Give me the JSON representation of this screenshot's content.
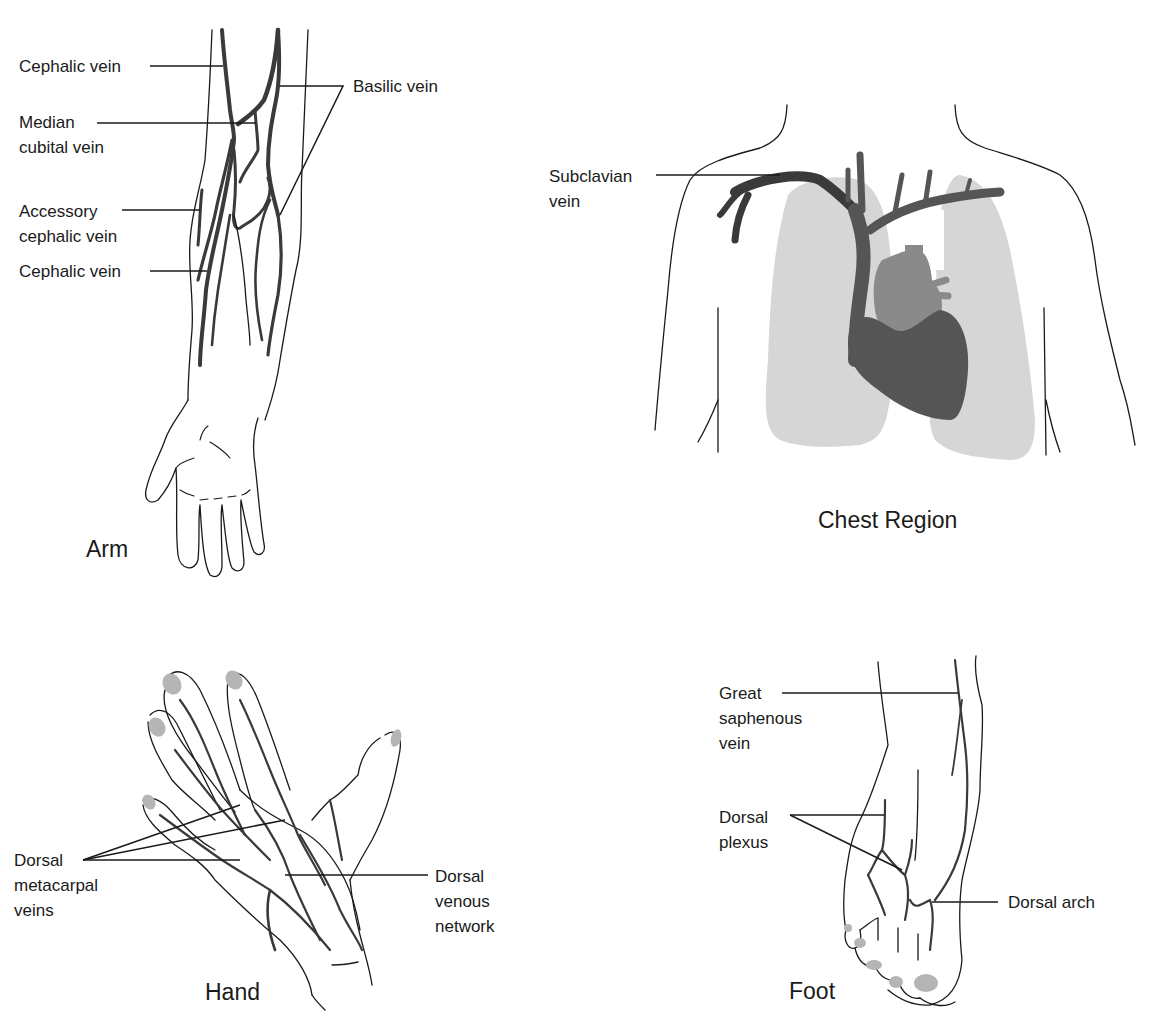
{
  "figure": {
    "panels": [
      {
        "id": "arm",
        "caption": "Arm",
        "labels": [
          {
            "id": "cephalic-vein-upper",
            "text": "Cephalic vein"
          },
          {
            "id": "basilic-vein",
            "text": "Basilic vein"
          },
          {
            "id": "median-cubital-vein",
            "text": "Median\ncubital vein"
          },
          {
            "id": "accessory-cephalic-vein",
            "text": "Accessory\ncephalic vein"
          },
          {
            "id": "cephalic-vein-lower",
            "text": "Cephalic vein"
          }
        ]
      },
      {
        "id": "chest",
        "caption": "Chest Region",
        "labels": [
          {
            "id": "subclavian-vein",
            "text": "Subclavian\nvein"
          }
        ]
      },
      {
        "id": "hand",
        "caption": "Hand",
        "labels": [
          {
            "id": "dorsal-metacarpal-veins",
            "text": "Dorsal\nmetacarpal\nveins"
          },
          {
            "id": "dorsal-venous-network",
            "text": "Dorsal\nvenous\nnetwork"
          }
        ]
      },
      {
        "id": "foot",
        "caption": "Foot",
        "labels": [
          {
            "id": "great-saphenous-vein",
            "text": "Great\nsaphenous\nvein"
          },
          {
            "id": "dorsal-plexus",
            "text": "Dorsal\nplexus"
          },
          {
            "id": "dorsal-arch",
            "text": "Dorsal arch"
          }
        ]
      }
    ],
    "colors": {
      "outline": "#1a1a1a",
      "vein": "#3a3a3a",
      "lung": "#d6d6d6",
      "heart": "#555555",
      "heart_upper": "#8a8a8a",
      "nail": "#b5b5b5"
    }
  }
}
